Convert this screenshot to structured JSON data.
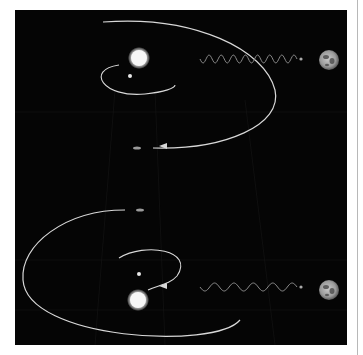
{
  "figure": {
    "background_color": "#050505",
    "page_color": "#ffffff",
    "orbit_color": "#d8d8d8",
    "wave_color": "#8a8a8a",
    "panels": [
      {
        "id": "top",
        "star": {
          "cx": 124,
          "cy": 48,
          "r": 8
        },
        "companion": {
          "cx": 115,
          "cy": 66,
          "r": 2
        },
        "inner_orbit": "M 104 55 C 70 60, 88 88, 130 84 C 150 82, 160 78, 160 75",
        "outer_orbit": "M 88 12 C 180 5, 250 40, 260 80 C 268 115, 210 140, 138 138",
        "arrow_at": {
          "x": 150,
          "y": 136
        },
        "probe": {
          "x": 122,
          "y": 138
        },
        "wave": {
          "x1": 185,
          "x2": 282,
          "y": 49,
          "amp": 4,
          "cycles": 8
        },
        "earth": {
          "cx": 314,
          "cy": 50,
          "r": 10
        }
      },
      {
        "id": "bottom",
        "star": {
          "cx": 123,
          "cy": 290,
          "r": 8
        },
        "companion": {
          "cx": 124,
          "cy": 264,
          "r": 2
        },
        "inner_orbit": "M 104 248 C 130 232, 180 240, 162 266 C 155 274, 145 275, 133 280",
        "outer_orbit": "M 110 200 C 50 200, 5 235, 8 270 C 12 330, 200 340, 225 310",
        "arrow_at": {
          "x": 150,
          "y": 276
        },
        "probe": {
          "x": 125,
          "y": 200
        },
        "wave": {
          "x1": 185,
          "x2": 282,
          "y": 277,
          "amp": 4,
          "cycles": 5
        },
        "earth": {
          "cx": 314,
          "cy": 280,
          "r": 10
        }
      }
    ]
  }
}
